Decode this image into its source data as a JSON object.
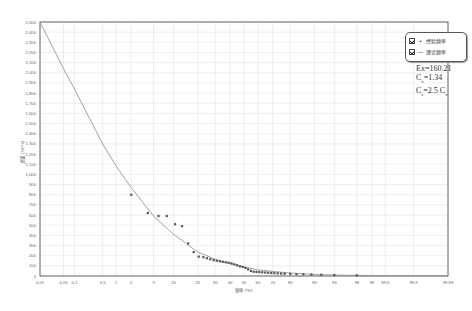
{
  "chart_data": {
    "type": "scatter",
    "title": "",
    "xlabel": "频率 (%)",
    "ylabel": "流量 (m³/s)",
    "x_scale": "probability",
    "ylim": [
      0,
      2500
    ],
    "grid": true,
    "legend_position": "top-right",
    "x_ticks": [
      "0.01",
      "0.05",
      "0.1",
      "0.5",
      "1",
      "2",
      "5",
      "10",
      "20",
      "30",
      "40",
      "50",
      "60",
      "70",
      "80",
      "90",
      "95",
      "98",
      "99",
      "99.5",
      "99.9",
      "99.99"
    ],
    "y_ticks": [
      "0",
      "100",
      "200",
      "300",
      "400",
      "500",
      "600",
      "700",
      "800",
      "900",
      "1,000",
      "1,100",
      "1,200",
      "1,300",
      "1,400",
      "1,500",
      "1,600",
      "1,700",
      "1,800",
      "1,900",
      "2,000",
      "2,100",
      "2,200",
      "2,300",
      "2,400",
      "2,500"
    ],
    "legend": [
      {
        "label": "经验频率",
        "symbol": "•",
        "checked": true
      },
      {
        "label": "理论频率",
        "symbol": "—",
        "checked": true
      }
    ],
    "annotations": {
      "ex": "Ex=160.21",
      "cv_label": "C",
      "cv_sub": "v",
      "cv_value": "=1.34",
      "cs_label": "C",
      "cs_sub": "s",
      "cs_value": "=2.5 C",
      "cs_value_sub": "v"
    },
    "series": [
      {
        "name": "经验频率",
        "kind": "points",
        "x": [
          2.0,
          4.0,
          6.0,
          8.0,
          10.5,
          13.0,
          15.5,
          18.0,
          20.5,
          23.0,
          25.0,
          27.0,
          29.0,
          31.0,
          33.0,
          35.0,
          37.0,
          39.0,
          41.0,
          43.0,
          45.0,
          47.0,
          49.0,
          51.0,
          53.0,
          55.0,
          57.0,
          59.0,
          61.0,
          63.0,
          65.0,
          67.0,
          69.0,
          71.0,
          73.0,
          75.0,
          77.0,
          80.0,
          83.0,
          86.0,
          89.0,
          92.0,
          95.0,
          98.0
        ],
        "values": [
          800,
          620,
          590,
          590,
          510,
          490,
          320,
          235,
          190,
          185,
          175,
          165,
          155,
          150,
          145,
          140,
          135,
          130,
          125,
          115,
          105,
          95,
          90,
          80,
          65,
          50,
          42,
          40,
          38,
          36,
          34,
          32,
          30,
          28,
          26,
          24,
          22,
          20,
          18,
          16,
          14,
          12,
          10,
          6
        ]
      },
      {
        "name": "理论频率",
        "kind": "line",
        "x": [
          0.01,
          0.05,
          0.1,
          0.5,
          1,
          2,
          5,
          10,
          20,
          30,
          40,
          50,
          60,
          70,
          80,
          90,
          95,
          98,
          99,
          99.5,
          99.9,
          99.99
        ],
        "values": [
          2500,
          2040,
          1840,
          1300,
          1080,
          870,
          590,
          410,
          236,
          165,
          120,
          90,
          60,
          45,
          30,
          15,
          10,
          6,
          5,
          4,
          3,
          2
        ]
      }
    ]
  },
  "colors": {
    "grid": "#dcdcdc",
    "axis": "#555555",
    "curve": "#8a8a8a",
    "points": "#555555",
    "text": "#666666"
  }
}
